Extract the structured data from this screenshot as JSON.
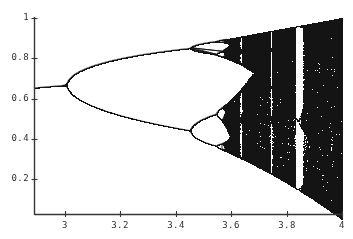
{
  "figure": {
    "name": "logistic-map-bifurcation-diagram",
    "background_color": "#ffffff",
    "ink_color": "#141414",
    "axis_color": "#3a3633"
  },
  "chart_data": {
    "type": "scatter",
    "title": "",
    "subtitle": "",
    "xlabel": "",
    "ylabel": "",
    "xlim": [
      2.88,
      4.0
    ],
    "ylim": [
      0.0,
      1.02
    ],
    "grid": false,
    "legend": null,
    "equation": "x_{n+1} = r * x_n * (1 - x_n)",
    "xticks": [
      3,
      3.2,
      3.4,
      3.6,
      3.8,
      4
    ],
    "xtick_labels": [
      "3",
      "3.2",
      "3.4",
      "3.6",
      "3.8",
      "4"
    ],
    "yticks": [
      0.2,
      0.4,
      0.6,
      0.8,
      1
    ],
    "ytick_labels": [
      "0.2",
      "0.4",
      "0.6",
      "0.8",
      "1"
    ],
    "series": [
      {
        "name": "attractor-points",
        "description": "Accumulated orbit of the logistic map after transient, sampled across r",
        "r_start": 2.88,
        "r_end": 4.0,
        "r_samples": 1100,
        "transient_iterations": 300,
        "plot_iterations": 180,
        "seed_x": 0.35
      }
    ],
    "annotations": [
      {
        "label": "fixed point branch",
        "r": 2.9,
        "x": 0.655
      },
      {
        "label": "period-2 onset",
        "r": 3.0,
        "x": 0.6667
      },
      {
        "label": "period-4 onset",
        "r": 3.449,
        "x": 0.44
      },
      {
        "label": "period-8 onset",
        "r": 3.544,
        "x": 0.52
      },
      {
        "label": "chaos onset",
        "r": 3.5699,
        "x": 0.5
      },
      {
        "label": "period-3 window",
        "r": 3.835,
        "x": 0.5
      },
      {
        "label": "period-5 window",
        "r": 3.74,
        "x": 0.5
      }
    ],
    "curve_envelope": {
      "upper_at_r4": 1.0,
      "lower_at_r4": 0.0
    }
  },
  "axes": {
    "plot_left_px": 34,
    "plot_right_px": 342,
    "plot_top_px": 18,
    "plot_bottom_px": 214,
    "y_value_at_top_px": 1.0,
    "x_value_at_left_px": 2.88
  },
  "ytick_positions_px": [
    179,
    139,
    99,
    58,
    18
  ],
  "xtick_positions_px": [
    65,
    120,
    176,
    231,
    287,
    342
  ]
}
